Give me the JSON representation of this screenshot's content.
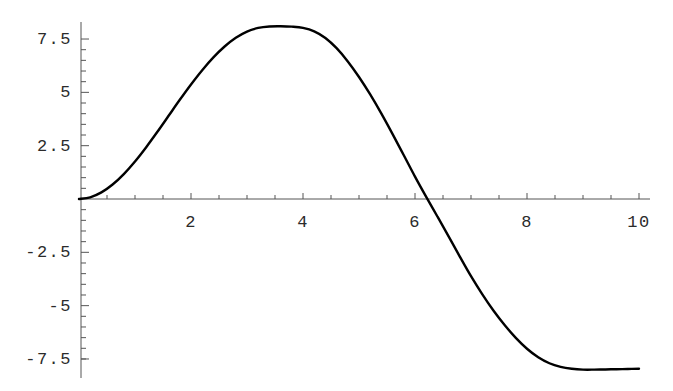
{
  "chart_data": {
    "type": "line",
    "title": "",
    "subtitle": "",
    "xlabel": "",
    "ylabel": "",
    "xlim": [
      0,
      10.35
    ],
    "ylim": [
      -8.2,
      8.6
    ],
    "grid": false,
    "legend": null,
    "axis_style": "mathematica-crossing-axes",
    "line_color": "#000000",
    "axis_color": "#555555",
    "tick_color": "#555555",
    "text_color": "#2b2b2b",
    "x_ticks_major": [
      2,
      4,
      6,
      8,
      10
    ],
    "x_tick_labels": [
      "2",
      "4",
      "6",
      "8",
      "10"
    ],
    "x_ticks_minor": [
      0.5,
      1,
      1.5,
      2.5,
      3,
      3.5,
      4.5,
      5,
      5.5,
      6.5,
      7,
      7.5,
      8.5,
      9,
      9.5
    ],
    "y_ticks_major": [
      7.5,
      5,
      2.5,
      -2.5,
      -5,
      -7.5
    ],
    "y_tick_labels": [
      "7.5",
      "5",
      "2.5",
      "-2.5",
      "-5",
      "-7.5"
    ],
    "y_ticks_minor": [
      7,
      6.5,
      6,
      5.5,
      4.5,
      4,
      3.5,
      3,
      2,
      1.5,
      1,
      0.5,
      -0.5,
      -1,
      -1.5,
      -2,
      -3,
      -3.5,
      -4,
      -4.5,
      -5.5,
      -6,
      -6.5,
      -7,
      -7.5
    ],
    "series": [
      {
        "name": "curve",
        "x": [
          0,
          0.2,
          0.4,
          0.6,
          0.8,
          1.0,
          1.2,
          1.4,
          1.6,
          1.8,
          2.0,
          2.2,
          2.4,
          2.6,
          2.8,
          3.0,
          3.2,
          3.4,
          3.6,
          3.8,
          4.0,
          4.2,
          4.4,
          4.6,
          4.8,
          5.0,
          5.2,
          5.4,
          5.6,
          5.8,
          6.0,
          6.2,
          6.4,
          6.6,
          6.8,
          7.0,
          7.2,
          7.4,
          7.6,
          7.8,
          8.0,
          8.2,
          8.4,
          8.6,
          8.8,
          9.0,
          9.2,
          9.4,
          9.6,
          9.8,
          10.0
        ],
        "y": [
          0.0,
          0.08,
          0.31,
          0.68,
          1.17,
          1.76,
          2.43,
          3.15,
          3.9,
          4.65,
          5.37,
          6.04,
          6.64,
          7.15,
          7.56,
          7.85,
          8.02,
          8.09,
          8.1,
          8.08,
          8.02,
          7.86,
          7.55,
          7.07,
          6.45,
          5.72,
          4.9,
          4.0,
          3.04,
          2.05,
          1.05,
          0.1,
          -0.82,
          -1.75,
          -2.7,
          -3.62,
          -4.46,
          -5.23,
          -5.91,
          -6.51,
          -7.02,
          -7.42,
          -7.7,
          -7.87,
          -7.96,
          -8.0,
          -8.0,
          -7.99,
          -7.98,
          -7.97,
          -7.96
        ]
      }
    ]
  }
}
